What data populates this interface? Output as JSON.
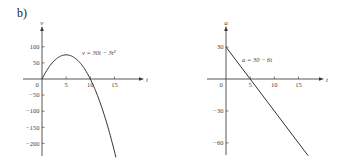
{
  "part_label": "b)",
  "chart_data": [
    {
      "type": "line",
      "title": "",
      "xlabel": "t",
      "ylabel": "v",
      "equation_label": "v = 30t − 3t²",
      "function": "30t - 3t^2",
      "x_ticks": [
        5,
        10,
        15
      ],
      "x_tick_labels": [
        "5",
        "10",
        "15"
      ],
      "origin_label": "0",
      "y_ticks": [
        100,
        50,
        -50,
        -100,
        -150,
        -200
      ],
      "y_tick_labels": [
        "100",
        "50",
        "−50",
        "−100",
        "−150",
        "−200"
      ],
      "xlim": [
        -5,
        18
      ],
      "ylim": [
        -240,
        140
      ],
      "x": [
        0,
        1,
        2,
        3,
        4,
        5,
        6,
        7,
        8,
        9,
        10,
        11,
        12,
        13,
        14,
        15,
        15.3
      ],
      "values": [
        0,
        27,
        48,
        63,
        72,
        75,
        72,
        63,
        48,
        27,
        0,
        -33,
        -72,
        -117,
        -168,
        -225,
        -243.27
      ],
      "grid": false
    },
    {
      "type": "line",
      "title": "",
      "xlabel": "t",
      "ylabel": "a",
      "equation_label": "a = 30 − 6t",
      "function": "30 - 6t",
      "x_ticks": [
        5,
        10,
        15
      ],
      "x_tick_labels": [
        "5",
        "10",
        "15"
      ],
      "origin_label": "0",
      "y_ticks": [
        30,
        -30,
        -60
      ],
      "y_tick_labels": [
        "30",
        "−30",
        "−60"
      ],
      "xlim": [
        -5,
        19
      ],
      "ylim": [
        -72,
        42
      ],
      "x": [
        0,
        17
      ],
      "values": [
        30,
        -72
      ],
      "grid": false
    }
  ]
}
